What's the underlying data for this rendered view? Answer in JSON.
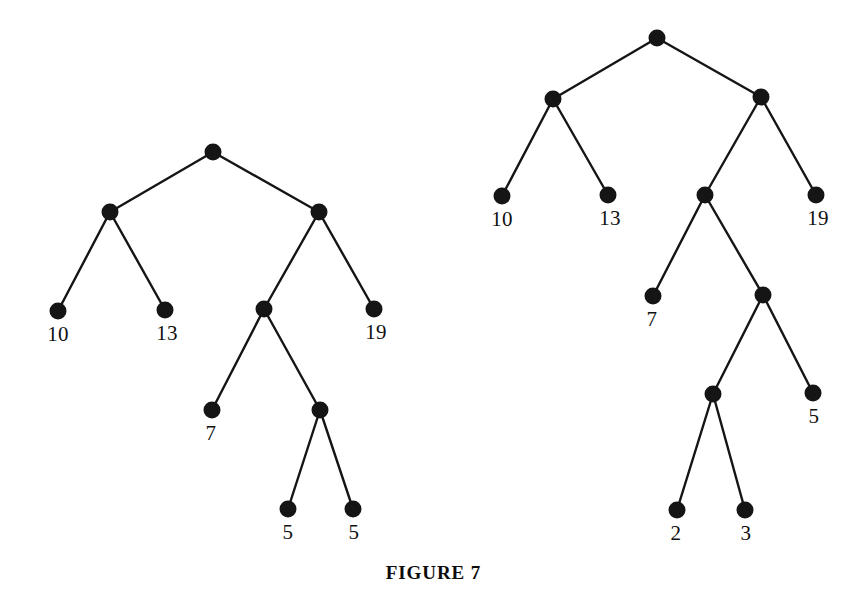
{
  "figure": {
    "caption": "FIGURE 7",
    "background_color": "#ffffff",
    "ink_color": "#151515",
    "node_radius": 8.5,
    "edge_width": 2.4,
    "width": 867,
    "height": 598
  },
  "chart_data": {
    "type": "diagram",
    "subtype": "binary-tree-pair",
    "title": "FIGURE 7",
    "trees": [
      {
        "name": "left-tree",
        "nodes": [
          {
            "id": "L0",
            "label": "",
            "x": 213,
            "y": 152,
            "depth": 0
          },
          {
            "id": "L1",
            "label": "",
            "x": 110,
            "y": 212,
            "depth": 1
          },
          {
            "id": "L2",
            "label": "",
            "x": 319,
            "y": 212,
            "depth": 1
          },
          {
            "id": "L3",
            "label": "10",
            "x": 58,
            "y": 311,
            "depth": 2,
            "label_x": 58,
            "label_y": 324
          },
          {
            "id": "L4",
            "label": "13",
            "x": 165,
            "y": 310,
            "depth": 2,
            "label_x": 167,
            "label_y": 323
          },
          {
            "id": "L5",
            "label": "",
            "x": 264,
            "y": 309,
            "depth": 2
          },
          {
            "id": "L6",
            "label": "19",
            "x": 374,
            "y": 309,
            "depth": 2,
            "label_x": 376,
            "label_y": 322
          },
          {
            "id": "L7",
            "label": "7",
            "x": 212,
            "y": 410,
            "depth": 3,
            "label_x": 211,
            "label_y": 423
          },
          {
            "id": "L8",
            "label": "",
            "x": 320,
            "y": 410,
            "depth": 3
          },
          {
            "id": "L9",
            "label": "5",
            "x": 288,
            "y": 509,
            "depth": 4,
            "label_x": 288,
            "label_y": 522
          },
          {
            "id": "L10",
            "label": "5",
            "x": 353,
            "y": 509,
            "depth": 4,
            "label_x": 354,
            "label_y": 522
          }
        ],
        "edges": [
          [
            "L0",
            "L1"
          ],
          [
            "L0",
            "L2"
          ],
          [
            "L1",
            "L3"
          ],
          [
            "L1",
            "L4"
          ],
          [
            "L2",
            "L5"
          ],
          [
            "L2",
            "L6"
          ],
          [
            "L5",
            "L7"
          ],
          [
            "L5",
            "L8"
          ],
          [
            "L8",
            "L9"
          ],
          [
            "L8",
            "L10"
          ]
        ],
        "leaf_values": [
          "10",
          "13",
          "7",
          "5",
          "5",
          "19"
        ]
      },
      {
        "name": "right-tree",
        "nodes": [
          {
            "id": "R0",
            "label": "",
            "x": 657,
            "y": 38,
            "depth": 0
          },
          {
            "id": "R1",
            "label": "",
            "x": 553,
            "y": 99,
            "depth": 1
          },
          {
            "id": "R2",
            "label": "",
            "x": 761,
            "y": 97,
            "depth": 1
          },
          {
            "id": "R3",
            "label": "10",
            "x": 502,
            "y": 196,
            "depth": 2,
            "label_x": 502,
            "label_y": 209
          },
          {
            "id": "R4",
            "label": "13",
            "x": 608,
            "y": 195,
            "depth": 2,
            "label_x": 610,
            "label_y": 208
          },
          {
            "id": "R5",
            "label": "",
            "x": 705,
            "y": 195,
            "depth": 2
          },
          {
            "id": "R6",
            "label": "19",
            "x": 816,
            "y": 195,
            "depth": 2,
            "label_x": 818,
            "label_y": 208
          },
          {
            "id": "R7",
            "label": "7",
            "x": 653,
            "y": 296,
            "depth": 3,
            "label_x": 652,
            "label_y": 309
          },
          {
            "id": "R8",
            "label": "",
            "x": 763,
            "y": 295,
            "depth": 3
          },
          {
            "id": "R9",
            "label": "",
            "x": 713,
            "y": 394,
            "depth": 4
          },
          {
            "id": "R10",
            "label": "5",
            "x": 813,
            "y": 393,
            "depth": 4,
            "label_x": 814,
            "label_y": 406
          },
          {
            "id": "R11",
            "label": "2",
            "x": 677,
            "y": 510,
            "depth": 5,
            "label_x": 676,
            "label_y": 523
          },
          {
            "id": "R12",
            "label": "3",
            "x": 745,
            "y": 510,
            "depth": 5,
            "label_x": 746,
            "label_y": 523
          }
        ],
        "edges": [
          [
            "R0",
            "R1"
          ],
          [
            "R0",
            "R2"
          ],
          [
            "R1",
            "R3"
          ],
          [
            "R1",
            "R4"
          ],
          [
            "R2",
            "R5"
          ],
          [
            "R2",
            "R6"
          ],
          [
            "R5",
            "R7"
          ],
          [
            "R5",
            "R8"
          ],
          [
            "R8",
            "R9"
          ],
          [
            "R8",
            "R10"
          ],
          [
            "R9",
            "R11"
          ],
          [
            "R9",
            "R12"
          ]
        ],
        "leaf_values": [
          "10",
          "13",
          "7",
          "2",
          "3",
          "5",
          "19"
        ]
      }
    ]
  }
}
